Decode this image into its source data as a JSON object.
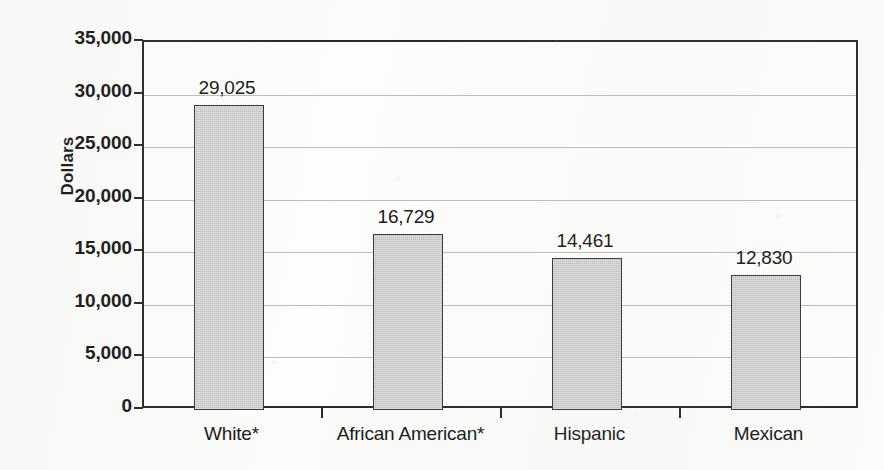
{
  "chart_data": {
    "type": "bar",
    "title": "",
    "xlabel": "",
    "ylabel": "Dollars",
    "categories": [
      "White*",
      "African American*",
      "Hispanic",
      "Mexican"
    ],
    "values": [
      29025,
      14461,
      12830,
      16729
    ],
    "value_labels": [
      "29,025",
      "16,729",
      "14,461",
      "12,830"
    ],
    "series": [
      {
        "name": "Dollars",
        "values": [
          29025,
          16729,
          14461,
          12830
        ]
      }
    ],
    "ylim": [
      0,
      35000
    ],
    "ytick_values": [
      0,
      5000,
      10000,
      15000,
      20000,
      25000,
      30000,
      35000
    ],
    "ytick_labels": [
      "0",
      "5,000",
      "10,000",
      "15,000",
      "20,000",
      "25,000",
      "30,000",
      "35,000"
    ],
    "grid": true,
    "legend": "none",
    "bar_color": "#c9c9c9",
    "bar_border_color": "#3a3a3a",
    "axis_color": "#2b2b2b",
    "gridline_color": "#bfbdb6",
    "background_color": "#fbfbf9"
  },
  "axis": {
    "y_title": "Dollars"
  }
}
